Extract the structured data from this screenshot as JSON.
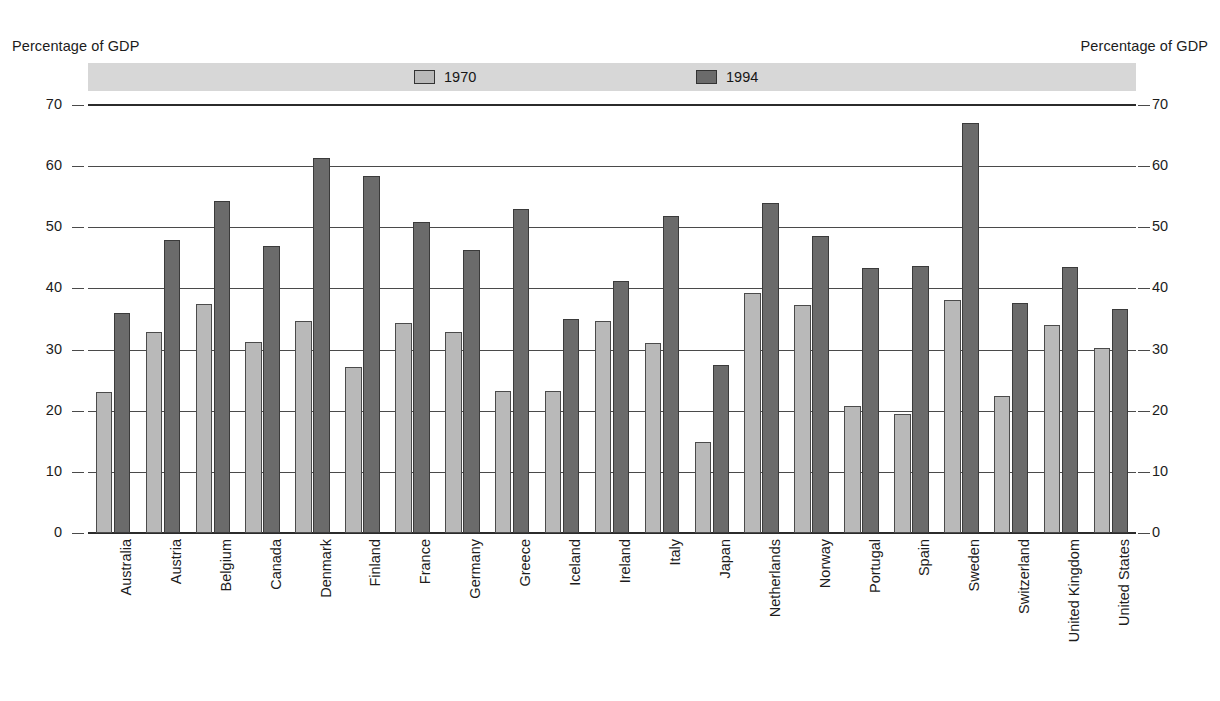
{
  "chart_data": {
    "type": "bar",
    "title": "",
    "xlabel": "",
    "ylabel": "Percentage of GDP",
    "ylabel_right": "Percentage of GDP",
    "ylim": [
      0,
      70
    ],
    "yticks": [
      0,
      10,
      20,
      30,
      40,
      50,
      60,
      70
    ],
    "grid": true,
    "legend_position": "top-center",
    "orientation": "vertical",
    "categories": [
      "Australia",
      "Austria",
      "Belgium",
      "Canada",
      "Denmark",
      "Finland",
      "France",
      "Germany",
      "Greece",
      "Iceland",
      "Ireland",
      "Italy",
      "Japan",
      "Netherlands",
      "Norway",
      "Portugal",
      "Spain",
      "Sweden",
      "Switzerland",
      "United Kingdom",
      "United States"
    ],
    "series": [
      {
        "name": "1970",
        "color": "#b9b9b9",
        "values": [
          23.0,
          32.8,
          37.4,
          31.3,
          34.7,
          27.1,
          34.4,
          32.8,
          23.3,
          23.3,
          34.7,
          31.1,
          14.9,
          39.2,
          37.3,
          20.8,
          19.5,
          38.1,
          22.4,
          34.0,
          30.2
        ]
      },
      {
        "name": "1994",
        "color": "#6b6b6b",
        "values": [
          36.0,
          48.0,
          54.3,
          46.9,
          61.4,
          58.4,
          50.8,
          46.3,
          53.0,
          35.0,
          41.2,
          51.8,
          27.5,
          53.9,
          48.5,
          43.4,
          43.6,
          67.0,
          37.7,
          43.5,
          36.7
        ]
      }
    ]
  },
  "legend": {
    "entries": [
      {
        "label": "1970",
        "swatch_color": "#b9b9b9"
      },
      {
        "label": "1994",
        "swatch_color": "#6b6b6b"
      }
    ]
  },
  "axes": {
    "left_title": "Percentage of GDP",
    "right_title": "Percentage of GDP",
    "tick_labels": [
      "70",
      "60",
      "50",
      "40",
      "30",
      "20",
      "10",
      "0"
    ]
  },
  "colors": {
    "series_1970": "#b9b9b9",
    "series_1994": "#6b6b6b",
    "legend_band": "#d7d7d7",
    "gridline": "#4a4a4a",
    "axis": "#2b2b2b",
    "text": "#1c1c1c",
    "background": "#ffffff"
  }
}
